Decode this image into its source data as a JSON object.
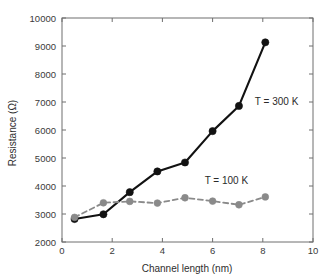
{
  "chart_data": {
    "type": "line",
    "title": "",
    "xlabel": "Channel length (nm)",
    "ylabel": "Resistance (Ω)",
    "xlim": [
      0,
      10
    ],
    "ylim": [
      2000,
      10000
    ],
    "xticks": [
      0,
      2,
      4,
      6,
      8,
      10
    ],
    "xtick_labels": [
      "0",
      "2",
      "4",
      "6",
      "8",
      "10"
    ],
    "yticks": [
      2000,
      3000,
      4000,
      5000,
      6000,
      7000,
      8000,
      9000,
      10000
    ],
    "ytick_labels": [
      "2000",
      "3000",
      "4000",
      "5000",
      "6000",
      "7000",
      "8000",
      "9000",
      "10000"
    ],
    "grid": false,
    "legend_position": "inline-annotation",
    "series": [
      {
        "name": "T = 300 K",
        "color": "#121212",
        "line_style": "solid",
        "marker": "circle",
        "x": [
          0.5,
          1.65,
          2.7,
          3.8,
          4.9,
          6.0,
          7.05,
          8.1
        ],
        "values": [
          2820,
          2990,
          3780,
          4520,
          4840,
          5960,
          6860,
          9130
        ]
      },
      {
        "name": "T = 100 K",
        "color": "#8a8a8a",
        "line_style": "dashed",
        "marker": "circle",
        "x": [
          0.5,
          1.65,
          2.7,
          3.8,
          4.9,
          6.0,
          7.05,
          8.1
        ],
        "values": [
          2880,
          3400,
          3450,
          3390,
          3580,
          3460,
          3330,
          3610
        ]
      }
    ],
    "annotations": [
      {
        "text": "T = 300 K",
        "x": 8.55,
        "y": 6900
      },
      {
        "text": "T = 100 K",
        "x": 6.55,
        "y": 4070
      }
    ]
  },
  "axes": {
    "x_title": "Channel length (nm)",
    "y_title": "Resistance (Ω)"
  },
  "colors": {
    "series_300k": "#121212",
    "series_100k": "#8a8a8a",
    "axis": "#6e6e6e",
    "text": "#2e2e2e",
    "background": "#ffffff"
  }
}
